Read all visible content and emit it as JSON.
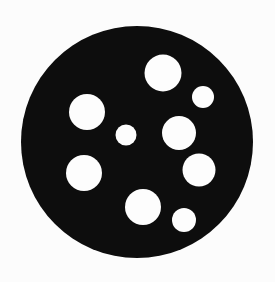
{
  "canvas": {
    "width": 275,
    "height": 282,
    "background_color": "#fcfcfc"
  },
  "figure": {
    "name": "perforated-disc",
    "shape_type": "silhouette",
    "disc_color": "#0d0d0d",
    "hole_color": "#fdfdfd",
    "edge_quality": "soft-antialiased"
  },
  "shape_data": {
    "type": "circle-packing-silhouette",
    "units": "pixels",
    "outer_disc": {
      "label": "disc",
      "cx": 137,
      "cy": 142,
      "r": 116,
      "fill": "#0d0d0d"
    },
    "holes": [
      {
        "label": "hole-top-large",
        "cx": 163,
        "cy": 73,
        "r": 18.5,
        "size_class": "large"
      },
      {
        "label": "hole-top-right-small",
        "cx": 203,
        "cy": 97,
        "r": 11.0,
        "size_class": "small"
      },
      {
        "label": "hole-upper-left-large",
        "cx": 87,
        "cy": 112,
        "r": 18.0,
        "size_class": "large"
      },
      {
        "label": "hole-center-small",
        "cx": 126,
        "cy": 135,
        "r": 10.5,
        "size_class": "small"
      },
      {
        "label": "hole-middle-right",
        "cx": 179,
        "cy": 133,
        "r": 17.0,
        "size_class": "medium"
      },
      {
        "label": "hole-lower-right",
        "cx": 199,
        "cy": 170,
        "r": 16.5,
        "size_class": "medium"
      },
      {
        "label": "hole-lower-left-large",
        "cx": 84,
        "cy": 173,
        "r": 18.0,
        "size_class": "large"
      },
      {
        "label": "hole-bottom-center",
        "cx": 143,
        "cy": 207,
        "r": 18.0,
        "size_class": "large"
      },
      {
        "label": "hole-bottom-right-small",
        "cx": 184,
        "cy": 220,
        "r": 12.0,
        "size_class": "small"
      }
    ],
    "hole_count": 9
  }
}
